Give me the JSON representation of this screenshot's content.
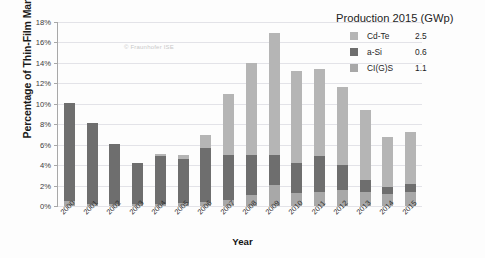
{
  "watermark": "© Fraunhofer ISE",
  "axes": {
    "ylabel": "Percentage of Thin-Film Market Share",
    "xlabel": "Year",
    "yticks": [
      "0%",
      "2%",
      "4%",
      "6%",
      "8%",
      "10%",
      "12%",
      "14%",
      "16%",
      "18%"
    ]
  },
  "legend": {
    "title": "Production 2015 (GWp)",
    "entries": [
      {
        "label": "Cd-Te",
        "value": "2.5",
        "color": "#b5b5b5"
      },
      {
        "label": "a-Si",
        "value": "0.6",
        "color": "#6e6e6e"
      },
      {
        "label": "CI(G)S",
        "value": "1.1",
        "color": "#a8a8a8"
      }
    ]
  },
  "chart_data": {
    "type": "bar",
    "title": "",
    "subtitle": "",
    "xlabel": "Year",
    "ylabel": "Percentage of Thin-Film Market Share",
    "ylim": [
      0,
      18
    ],
    "ytick_step": 2,
    "grid": true,
    "stacked": true,
    "legend_position": "top-right",
    "categories": [
      "2000",
      "2001",
      "2002",
      "2003",
      "2004",
      "2005",
      "2006",
      "2007",
      "2008",
      "2009",
      "2010",
      "2011",
      "2012",
      "2013",
      "2014",
      "2015"
    ],
    "series": [
      {
        "name": "CI(G)S",
        "color": "#a8a8a8",
        "values": [
          0.5,
          0.2,
          0.2,
          0.2,
          0.2,
          0.3,
          0.4,
          0.6,
          1.1,
          2.1,
          1.3,
          1.4,
          1.6,
          1.4,
          1.2,
          1.4
        ]
      },
      {
        "name": "a-Si",
        "color": "#6e6e6e",
        "values": [
          9.6,
          7.9,
          5.9,
          4.0,
          4.7,
          4.3,
          5.3,
          4.4,
          3.9,
          2.9,
          2.9,
          3.5,
          2.4,
          1.1,
          0.7,
          0.8
        ]
      },
      {
        "name": "Cd-Te",
        "color": "#b5b5b5",
        "values": [
          0.0,
          0.0,
          0.0,
          0.0,
          0.2,
          0.4,
          1.2,
          6.0,
          9.0,
          11.9,
          9.0,
          8.5,
          7.6,
          6.9,
          4.9,
          5.0
        ]
      }
    ],
    "totals": [
      10.1,
      8.1,
      6.1,
      4.2,
      5.1,
      5.0,
      6.9,
      11.0,
      14.0,
      16.9,
      13.2,
      13.4,
      11.6,
      9.4,
      6.8,
      7.2
    ]
  }
}
